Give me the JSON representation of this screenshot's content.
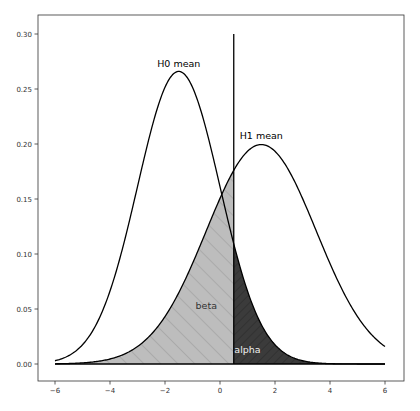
{
  "chart_data": {
    "type": "line",
    "title": "",
    "xlabel": "",
    "ylabel": "",
    "xlim": [
      -6.3,
      6.3
    ],
    "ylim": [
      -0.015,
      0.315
    ],
    "grid": false,
    "legend": null,
    "x_ticks": [
      -6,
      -4,
      -2,
      0,
      2,
      4,
      6
    ],
    "x_tick_labels": [
      "−6",
      "−4",
      "−2",
      "0",
      "2",
      "4",
      "6"
    ],
    "y_ticks": [
      0.0,
      0.05,
      0.1,
      0.15,
      0.2,
      0.25,
      0.3
    ],
    "y_tick_labels": [
      "0.00",
      "0.05",
      "0.10",
      "0.15",
      "0.20",
      "0.25",
      "0.30"
    ],
    "series": [
      {
        "name": "H0",
        "distribution": "normal",
        "mean": -1.5,
        "std": 1.5,
        "peak": 0.266,
        "x_range": [
          -6,
          6
        ],
        "color": "#000000"
      },
      {
        "name": "H1",
        "distribution": "normal",
        "mean": 1.5,
        "std": 2.0,
        "peak": 0.199,
        "x_range": [
          -6,
          6
        ],
        "color": "#000000"
      }
    ],
    "baseline": {
      "y": 0,
      "x_range": [
        -6,
        6
      ],
      "color": "#000000"
    },
    "threshold": {
      "x": 0.5,
      "y_range": [
        0,
        0.3
      ],
      "color": "#000000"
    },
    "fills": [
      {
        "name": "beta",
        "under": "H1",
        "x_range": [
          -6,
          0.5
        ],
        "color": "#bdbdbd",
        "hatch": "\\\\"
      },
      {
        "name": "alpha",
        "under": "H0",
        "x_range": [
          0.5,
          6
        ],
        "color": "#3b3b3b",
        "hatch": "//"
      }
    ],
    "annotations": [
      {
        "text": "H0 mean",
        "x": -1.5,
        "y": 0.27,
        "color": "#000000"
      },
      {
        "text": "H1 mean",
        "x": 1.5,
        "y": 0.205,
        "color": "#000000"
      },
      {
        "text": "beta",
        "x": -0.5,
        "y": 0.05,
        "color": "#333333"
      },
      {
        "text": "alpha",
        "x": 1.0,
        "y": 0.01,
        "color": "#eeeeee"
      }
    ]
  }
}
